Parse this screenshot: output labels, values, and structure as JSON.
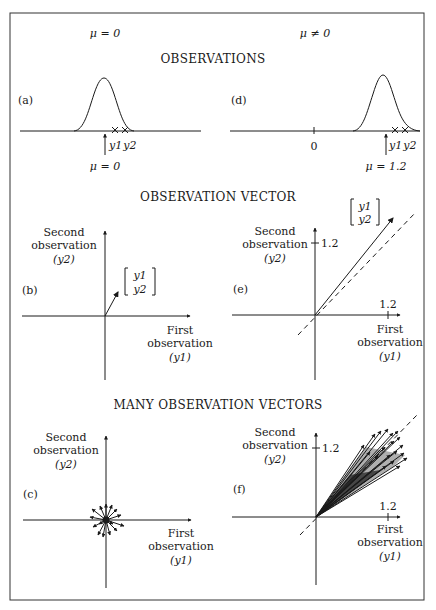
{
  "figure": {
    "column_headers": {
      "left": "μ = 0",
      "right": "μ ≠ 0"
    },
    "sections": [
      {
        "title": "OBSERVATIONS"
      },
      {
        "title": "OBSERVATION VECTOR"
      },
      {
        "title": "MANY OBSERVATION VECTORS"
      }
    ],
    "panels": {
      "a": {
        "label": "(a)",
        "obs_labels": [
          "y1",
          "y2"
        ],
        "mean_label": "μ = 0"
      },
      "d": {
        "label": "(d)",
        "zero_tick": "0",
        "obs_labels": [
          "y1",
          "y2"
        ],
        "mean_label": "μ = 1.2"
      },
      "b": {
        "label": "(b)",
        "vector_label": [
          "y1",
          "y2"
        ]
      },
      "e": {
        "label": "(e)",
        "vector_label": [
          "y1",
          "y2"
        ],
        "tick_y": "1.2",
        "tick_x": "1.2"
      },
      "c": {
        "label": "(c)"
      },
      "f": {
        "label": "(f)",
        "tick_y": "1.2",
        "tick_x": "1.2"
      }
    },
    "axis_labels": {
      "y_line1": "Second",
      "y_line2": "observation",
      "y_line3": "(y2)",
      "x_line1": "First",
      "x_line2": "observation",
      "x_line3": "(y1)"
    }
  }
}
